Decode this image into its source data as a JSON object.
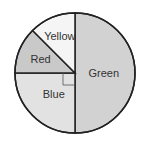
{
  "chart_data": {
    "type": "pie",
    "title": "",
    "slices": [
      {
        "label": "Green",
        "value": 50,
        "color": "#d2d2d2"
      },
      {
        "label": "Blue",
        "value": 25,
        "color": "#e2e2e2"
      },
      {
        "label": "Red",
        "value": 12.5,
        "color": "#c9c9c9"
      },
      {
        "label": "Yellow",
        "value": 12.5,
        "color": "#f5f5f5"
      }
    ],
    "annotations": [
      "right-angle marker on Blue slice"
    ],
    "legend": "none"
  }
}
